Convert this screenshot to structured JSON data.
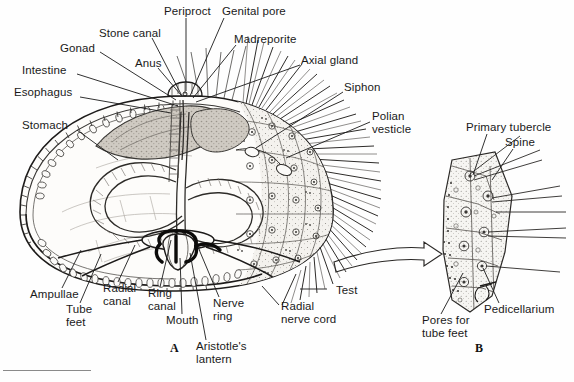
{
  "figure": {
    "panel_a_marker": "A",
    "panel_b_marker": "B",
    "background_color": "#fefefe",
    "ink_color": "#1a1a1a"
  },
  "panel_a": {
    "marker": "A",
    "labels": [
      {
        "id": "esophagus",
        "text": "Esophagus",
        "x": 14,
        "y": 86,
        "lx": 80,
        "ly": 97,
        "tx": 171,
        "ty": 113
      },
      {
        "id": "intestine",
        "text": "Intestine",
        "x": 22,
        "y": 64,
        "lx": 77,
        "ly": 74,
        "tx": 178,
        "ty": 106
      },
      {
        "id": "gonad",
        "text": "Gonad",
        "x": 60,
        "y": 42,
        "lx": 100,
        "ly": 52,
        "tx": 176,
        "ty": 100
      },
      {
        "id": "stomach",
        "text": "Stomach",
        "x": 22,
        "y": 119,
        "lx": 77,
        "ly": 130,
        "tx": 118,
        "ty": 160
      },
      {
        "id": "stone-canal",
        "text": "Stone canal",
        "x": 99,
        "y": 27,
        "lx": 152,
        "ly": 38,
        "tx": 182,
        "ty": 96
      },
      {
        "id": "anus",
        "text": "Anus",
        "x": 135,
        "y": 57,
        "lx": 158,
        "ly": 68,
        "tx": 181,
        "ty": 95
      },
      {
        "id": "periproct",
        "text": "Periproct",
        "x": 164,
        "y": 5,
        "lx": 186,
        "ly": 18,
        "tx": 186,
        "ty": 91
      },
      {
        "id": "genital-pore",
        "text": "Genital pore",
        "x": 222,
        "y": 5,
        "lx": 224,
        "ly": 18,
        "tx": 190,
        "ty": 96
      },
      {
        "id": "madreporite",
        "text": "Madreporite",
        "x": 234,
        "y": 33,
        "lx": 236,
        "ly": 45,
        "tx": 193,
        "ty": 98
      },
      {
        "id": "axial-gland",
        "text": "Axial gland",
        "x": 301,
        "y": 54,
        "lx": 300,
        "ly": 65,
        "tx": 196,
        "ty": 102
      },
      {
        "id": "siphon",
        "text": "Siphon",
        "x": 344,
        "y": 81,
        "lx": 343,
        "ly": 92,
        "tx": 256,
        "ty": 148
      },
      {
        "id": "polian-vesicle",
        "text": "Polian\nvesticle",
        "x": 372,
        "y": 110,
        "lx": 370,
        "ly": 122,
        "tx": 286,
        "ty": 158
      },
      {
        "id": "test",
        "text": "Test",
        "x": 330,
        "y": 284,
        "lx": 327,
        "ly": 289,
        "tx": 300,
        "ty": 289
      },
      {
        "id": "radial-nerve-cord",
        "text": "Radial\nnerve cord",
        "x": 281,
        "y": 300,
        "lx": 279,
        "ly": 305,
        "tx": 262,
        "ty": 286
      },
      {
        "id": "nerve-ring",
        "text": "Nerve\nring",
        "x": 213,
        "y": 297,
        "lx": 219,
        "ly": 297,
        "tx": 198,
        "ty": 247
      },
      {
        "id": "aristotles-lantern",
        "text": "Aristotle's\nlantern",
        "x": 196,
        "y": 340,
        "lx": 206,
        "ly": 340,
        "tx": 190,
        "ty": 253
      },
      {
        "id": "mouth",
        "text": "Mouth",
        "x": 166,
        "y": 314,
        "lx": 182,
        "ly": 314,
        "tx": 180,
        "ty": 258
      },
      {
        "id": "ring-canal",
        "text": "Ring\ncanal",
        "x": 148,
        "y": 287,
        "lx": 160,
        "ly": 287,
        "tx": 171,
        "ty": 240
      },
      {
        "id": "radial-canal",
        "text": "Radial\ncanal",
        "x": 103,
        "y": 282,
        "lx": 118,
        "ly": 282,
        "tx": 135,
        "ty": 245
      },
      {
        "id": "tube-feet",
        "text": "Tube\nfeet",
        "x": 66,
        "y": 303,
        "lx": 80,
        "ly": 303,
        "tx": 101,
        "ty": 254
      },
      {
        "id": "ampullae",
        "text": "Ampullae",
        "x": 30,
        "y": 288,
        "lx": 62,
        "ly": 288,
        "tx": 81,
        "ty": 250
      }
    ]
  },
  "panel_b": {
    "marker": "B",
    "labels": [
      {
        "id": "primary-tubercle",
        "text": "Primary tubercle",
        "x": 466,
        "y": 121,
        "lx": 487,
        "ly": 134,
        "tx": 473,
        "ty": 175
      },
      {
        "id": "spine",
        "text": "Spine",
        "x": 505,
        "y": 136,
        "lx": 513,
        "ly": 149,
        "tx": 492,
        "ty": 180
      },
      {
        "id": "pedicellarium",
        "text": "Pedicellarium",
        "x": 484,
        "y": 303,
        "lx": 499,
        "ly": 303,
        "tx": 483,
        "ty": 268
      },
      {
        "id": "pores-for-tube-feet",
        "text": "Pores for\ntube feet",
        "x": 422,
        "y": 314,
        "lx": 441,
        "ly": 314,
        "tx": 463,
        "ty": 273
      }
    ]
  },
  "connector": {
    "id": "magnification-arrow",
    "description": "curved outlined arrow from panel A to panel B"
  }
}
